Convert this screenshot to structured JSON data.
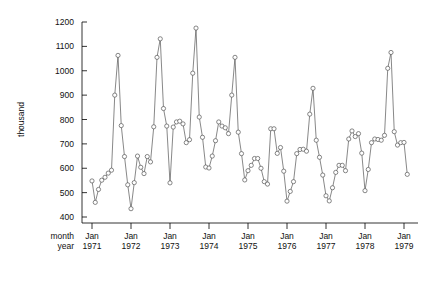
{
  "chart_data": {
    "type": "line",
    "title": "",
    "subtitle": "",
    "xlabel": "",
    "ylabel": "thousand",
    "row_labels": [
      "month",
      "year"
    ],
    "grid": false,
    "legend": "none",
    "marker": "open-circle",
    "line_color": "#555555",
    "marker_color": "#555555",
    "axis_color": "#000000",
    "ylim": [
      400,
      1200
    ],
    "yticks": [
      400,
      500,
      600,
      700,
      800,
      900,
      1000,
      1100,
      1200
    ],
    "ytick_labels": [
      "400",
      "500",
      "600",
      "700",
      "800",
      "900",
      "1000",
      "1100",
      "1200"
    ],
    "xticks": [
      0,
      12,
      24,
      36,
      48,
      60,
      72,
      84,
      96
    ],
    "xtick_month_labels": [
      "Jan",
      "Jan",
      "Jan",
      "Jan",
      "Jan",
      "Jan",
      "Jan",
      "Jan",
      "Jan"
    ],
    "xtick_year_labels": [
      "1971",
      "1972",
      "1973",
      "1974",
      "1975",
      "1976",
      "1977",
      "1978",
      "1979"
    ],
    "xlim": [
      -1,
      99
    ],
    "x": [
      0,
      1,
      2,
      3,
      4,
      5,
      6,
      7,
      8,
      9,
      10,
      11,
      12,
      13,
      14,
      15,
      16,
      17,
      18,
      19,
      20,
      21,
      22,
      23,
      24,
      25,
      26,
      27,
      28,
      29,
      30,
      31,
      32,
      33,
      34,
      35,
      36,
      37,
      38,
      39,
      40,
      41,
      42,
      43,
      44,
      45,
      46,
      47,
      48,
      49,
      50,
      51,
      52,
      53,
      54,
      55,
      56,
      57,
      58,
      59,
      60,
      61,
      62,
      63,
      64,
      65,
      66,
      67,
      68,
      69,
      70,
      71,
      72,
      73,
      74,
      75,
      76,
      77,
      78,
      79,
      80,
      81,
      82,
      83,
      84,
      85,
      86,
      87,
      88,
      89,
      90,
      91,
      92,
      93,
      94,
      95,
      96,
      97
    ],
    "values": [
      548,
      460,
      513,
      551,
      563,
      580,
      592,
      900,
      1063,
      775,
      648,
      532,
      434,
      541,
      650,
      604,
      578,
      648,
      626,
      770,
      1055,
      1131,
      845,
      773,
      540,
      769,
      790,
      793,
      782,
      705,
      717,
      990,
      1175,
      810,
      727,
      605,
      601,
      650,
      713,
      790,
      773,
      766,
      742,
      900,
      1055,
      748,
      660,
      552,
      590,
      612,
      640,
      640,
      600,
      545,
      535,
      762,
      762,
      661,
      685,
      588,
      465,
      505,
      545,
      660,
      677,
      678,
      670,
      822,
      928,
      715,
      645,
      572,
      487,
      466,
      520,
      583,
      612,
      612,
      590,
      720,
      753,
      730,
      742,
      662,
      508,
      595,
      705,
      720,
      718,
      715,
      735,
      1010,
      1075,
      750,
      695,
      705,
      706,
      575
    ],
    "series": [
      {
        "name": "monthly series",
        "values": [
          548,
          460,
          513,
          551,
          563,
          580,
          592,
          900,
          1063,
          775,
          648,
          532,
          434,
          541,
          650,
          604,
          578,
          648,
          626,
          770,
          1055,
          1131,
          845,
          773,
          540,
          769,
          790,
          793,
          782,
          705,
          717,
          990,
          1175,
          810,
          727,
          605,
          601,
          650,
          713,
          790,
          773,
          766,
          742,
          900,
          1055,
          748,
          660,
          552,
          590,
          612,
          640,
          640,
          600,
          545,
          535,
          762,
          762,
          661,
          685,
          588,
          465,
          505,
          545,
          660,
          677,
          678,
          670,
          822,
          928,
          715,
          645,
          572,
          487,
          466,
          520,
          583,
          612,
          612,
          590,
          720,
          753,
          730,
          742,
          662,
          508,
          595,
          705,
          720,
          718,
          715,
          735,
          1010,
          1075,
          750,
          695,
          705,
          706,
          575
        ]
      }
    ],
    "annotations": []
  }
}
